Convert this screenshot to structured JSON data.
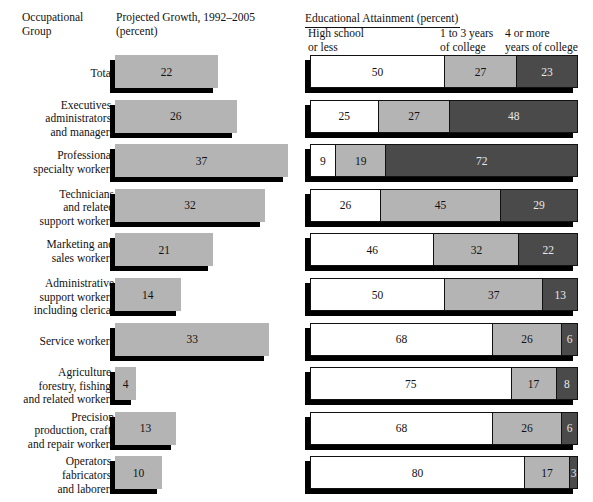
{
  "headers": {
    "left_title_line1": "Occupational",
    "left_title_line2": "Group",
    "growth_title_line1": "Projected Growth, 1992–2005",
    "growth_title_line2": "(percent)",
    "right_title": "Educational Attainment (percent)",
    "col1_line1": "High school",
    "col1_line2": "or less",
    "col2_line1": "1 to 3 years",
    "col2_line2": "of college",
    "col3_line1": "4 or more",
    "col3_line2": "years of college"
  },
  "colors": {
    "growth_bar": "#b4b4b4",
    "segment_high_school": "#ffffff",
    "segment_some_college": "#b4b4b4",
    "segment_four_plus": "#4a4a4a",
    "shadow": "#000000",
    "text": "#111111"
  },
  "chart_data": {
    "type": "bar",
    "xlabel": "",
    "ylabel": "Occupational Group",
    "categories": [
      "Total",
      "Executives,\nadministrators,\nand managers",
      "Professional\nspecialty workers",
      "Technicians\nand related\nsupport workers",
      "Marketing and\nsales workers",
      "Administrative\nsupport workers\nincluding clerical",
      "Service workers",
      "Agriculture,\nforestry, fishing,\nand related workers",
      "Precision\nproduction, craft,\nand repair workers",
      "Operators,\nfabricators,\nand laborers"
    ],
    "panels": [
      {
        "name": "Projected Growth, 1992–2005 (percent)",
        "type": "bar",
        "orientation": "horizontal",
        "xlim": [
          0,
          40
        ],
        "values": [
          22,
          26,
          37,
          32,
          21,
          14,
          33,
          4,
          13,
          10
        ]
      },
      {
        "name": "Educational Attainment (percent)",
        "type": "bar",
        "orientation": "horizontal",
        "stacked": true,
        "xlim": [
          0,
          100
        ],
        "series": [
          {
            "name": "High school or less",
            "values": [
              50,
              25,
              9,
              26,
              46,
              50,
              68,
              75,
              68,
              80
            ]
          },
          {
            "name": "1 to 3 years of college",
            "values": [
              27,
              27,
              19,
              45,
              32,
              37,
              26,
              17,
              26,
              17
            ]
          },
          {
            "name": "4 or more years of college",
            "values": [
              23,
              48,
              72,
              29,
              22,
              13,
              6,
              8,
              6,
              3
            ]
          }
        ]
      }
    ],
    "legend_position": "top",
    "grid": false
  }
}
